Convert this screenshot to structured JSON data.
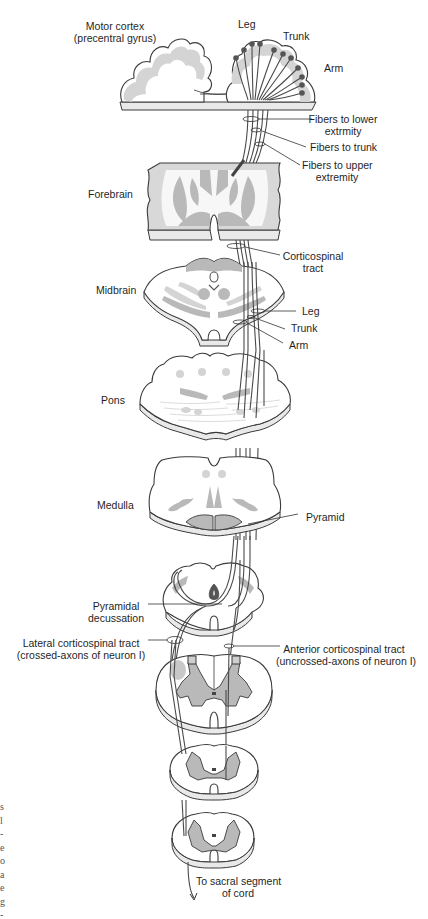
{
  "figure": {
    "colors": {
      "outline": "#3a3a3a",
      "gray_matter": "#b9b9b9",
      "light_gray": "#d6d6d6",
      "fiber": "#4a4a4a",
      "neuron_body": "#555555",
      "background": "#ffffff"
    },
    "levels": [
      {
        "id": "cortex",
        "label_line1": "Motor cortex",
        "label_line2": "(precentral gyrus)"
      },
      {
        "id": "forebrain",
        "label": "Forebrain"
      },
      {
        "id": "midbrain",
        "label": "Midbrain"
      },
      {
        "id": "pons",
        "label": "Pons"
      },
      {
        "id": "medulla",
        "label": "Medulla"
      }
    ],
    "somatotopy": {
      "leg": "Leg",
      "trunk": "Trunk",
      "arm": "Arm"
    },
    "fiber_labels": {
      "lower_line1": "Fibers to lower",
      "lower_line2": "extrmity",
      "trunk": "Fibers to trunk",
      "upper_line1": "Fibers to upper",
      "upper_line2": "extremity"
    },
    "tract_labels": {
      "corticospinal_line1": "Corticospinal",
      "corticospinal_line2": "tract",
      "mid_leg": "Leg",
      "mid_trunk": "Trunk",
      "mid_arm": "Arm",
      "pyramid": "Pyramid",
      "decussation_line1": "Pyramidal",
      "decussation_line2": "decussation",
      "lateral_line1": "Lateral corticospinal tract",
      "lateral_line2": "(crossed-axons of neuron I)",
      "anterior_line1": "Anterior corticospinal tract",
      "anterior_line2": "(uncrossed-axons of neuron I)",
      "sacral_line1": "To sacral segment",
      "sacral_line2": "of cord"
    },
    "edge_text_fragment": [
      "s",
      "l",
      "-",
      "e",
      "o",
      "a",
      "e",
      "g",
      "-"
    ]
  }
}
